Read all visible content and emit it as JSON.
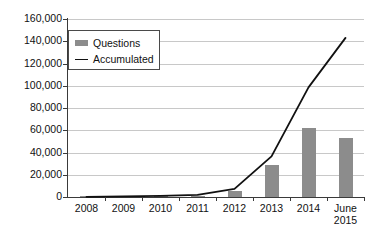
{
  "chart_data": {
    "type": "bar",
    "title": "",
    "xlabel": "",
    "ylabel": "",
    "categories": [
      "2008",
      "2009",
      "2010",
      "2011",
      "2012",
      "2013",
      "2014",
      "June\n2015"
    ],
    "category_labels": [
      {
        "line1": "2008",
        "line2": ""
      },
      {
        "line1": "2009",
        "line2": ""
      },
      {
        "line1": "2010",
        "line2": ""
      },
      {
        "line1": "2011",
        "line2": ""
      },
      {
        "line1": "2012",
        "line2": ""
      },
      {
        "line1": "2013",
        "line2": ""
      },
      {
        "line1": "2014",
        "line2": ""
      },
      {
        "line1": "June",
        "line2": "2015"
      }
    ],
    "ylim": [
      0,
      160000
    ],
    "ytick_step": 20000,
    "ytick_labels": [
      "160,000",
      "140,000",
      "120,000",
      "100,000",
      "80,000",
      "60,000",
      "40,000",
      "20,000",
      "0"
    ],
    "ytick_values": [
      160000,
      140000,
      120000,
      100000,
      80000,
      60000,
      40000,
      20000,
      0
    ],
    "grid": true,
    "legend_position": "top-left",
    "series": [
      {
        "name": "Questions",
        "kind": "bar",
        "color": "#8c8c8c",
        "values": [
          200,
          300,
          500,
          900,
          5400,
          29000,
          62000,
          53000
        ]
      },
      {
        "name": "Accumulated",
        "kind": "line",
        "color": "#111111",
        "values": [
          200,
          500,
          1000,
          1900,
          7300,
          36500,
          98500,
          143000
        ]
      }
    ]
  },
  "legend": {
    "items": [
      {
        "label": "Questions",
        "marker": "bar-swatch"
      },
      {
        "label": "Accumulated",
        "marker": "line-swatch"
      }
    ]
  }
}
